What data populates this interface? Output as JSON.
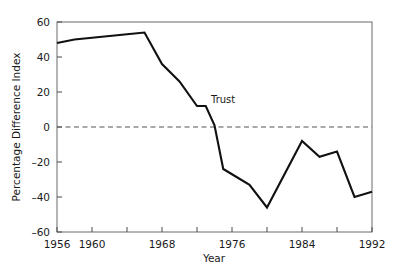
{
  "chart_data": {
    "type": "line",
    "title": "",
    "xlabel": "Year",
    "ylabel": "Percentage Difference Index",
    "xlim": [
      1956,
      1992
    ],
    "ylim": [
      -60,
      60
    ],
    "grid": false,
    "legend": "none",
    "xticks": [
      1956,
      1960,
      1964,
      1968,
      1972,
      1976,
      1980,
      1984,
      1988,
      1992
    ],
    "xticklabels": [
      "1956",
      "1960",
      "",
      "1968",
      "",
      "1976",
      "",
      "1984",
      "",
      "1992"
    ],
    "yticks": [
      -60,
      -40,
      -20,
      0,
      20,
      40,
      60
    ],
    "yticklabels": [
      "–60",
      "–40",
      "–20",
      "0",
      "20",
      "40",
      "60"
    ],
    "reference_line": {
      "y": 0,
      "style": "dashed",
      "color": "#555555"
    },
    "annotations": [
      {
        "text": "Trust",
        "x": 1973.6,
        "y": 14
      }
    ],
    "series": [
      {
        "name": "Trust",
        "color": "#111111",
        "x": [
          1956,
          1958,
          1960,
          1962,
          1964,
          1966,
          1968,
          1970,
          1972,
          1973,
          1974,
          1975,
          1976,
          1978,
          1980,
          1984,
          1986,
          1988,
          1990,
          1992
        ],
        "values": [
          48,
          50,
          51,
          52,
          53,
          54,
          36,
          26,
          12,
          12,
          1,
          -24,
          -27,
          -33,
          -46,
          -8,
          -17,
          -14,
          -40,
          -37
        ]
      }
    ]
  },
  "axis": {
    "x_title": "Year",
    "y_title": "Percentage Difference Index"
  }
}
